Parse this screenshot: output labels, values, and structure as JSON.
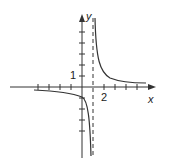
{
  "figure": {
    "type": "function-graph",
    "axes": {
      "x_label": "x",
      "y_label": "y"
    },
    "tick_labels": {
      "x": "2",
      "y": "1"
    },
    "asymptote": {
      "vertical_x": 1,
      "style": "dashed"
    },
    "colors": {
      "curve": "#333333",
      "axes": "#333333",
      "background": "#ffffff"
    }
  }
}
